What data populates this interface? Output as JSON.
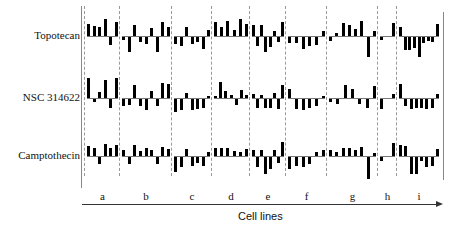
{
  "chart_data": {
    "type": "bar",
    "title": "",
    "xlabel": "Cell lines",
    "ylabel": "",
    "rows": [
      "Topotecan",
      "NSC 314622",
      "Camptothecin"
    ],
    "categories": [
      "a",
      "b",
      "c",
      "d",
      "e",
      "f",
      "g",
      "h",
      "i"
    ],
    "grid": false,
    "note": "Small-multiple bar patterns; values are relative deviations (unitless), positive up, negative down, estimated from pixel heights (scale ~ -1..1).",
    "series": [
      {
        "name": "Topotecan",
        "groups": {
          "a": [
            0.6,
            0.5,
            0.45,
            0.85,
            -0.4,
            0.7
          ],
          "b": [
            -0.15,
            -0.75,
            0.55,
            -0.25,
            -0.35,
            0.4,
            -0.75,
            0.7,
            0.45
          ],
          "c": [
            -0.35,
            -0.45,
            0.45,
            -0.35,
            -0.25,
            -0.6,
            0.3
          ],
          "d": [
            0.7,
            0.45,
            0.75,
            0.3,
            0.85,
            0.6
          ],
          "e": [
            0.55,
            -0.45,
            0.55,
            -0.75,
            -0.5,
            0.25,
            -0.25,
            0.7
          ],
          "f": [
            -0.3,
            -0.3,
            -0.6,
            -0.45,
            -0.4,
            0.25
          ],
          "g": [
            -0.2,
            0.15,
            0.65,
            0.55,
            0.35,
            0.75,
            -1.0,
            0.25
          ],
          "h": [
            -0.15,
            0.65
          ],
          "i": [
            0.45,
            -0.65,
            -0.65,
            -0.55,
            -1.0,
            -0.3,
            -0.2,
            -0.25,
            0.6
          ]
        }
      },
      {
        "name": "NSC 314622",
        "groups": {
          "a": [
            1.0,
            -0.15,
            0.3,
            0.9,
            -0.45,
            1.0
          ],
          "b": [
            -0.35,
            -0.3,
            0.65,
            -0.35,
            -0.55,
            0.35,
            -0.35,
            0.75,
            0.7
          ],
          "c": [
            -0.65,
            -0.55,
            0.25,
            -0.55,
            -0.5,
            -0.45,
            0.1
          ],
          "d": [
            0.1,
            0.8,
            0.35,
            0.15,
            -0.3,
            0.4,
            0.15
          ],
          "e": [
            0.2,
            -0.45,
            0.15,
            -0.45,
            -0.45,
            0.25,
            -0.5,
            0.65
          ],
          "f": [
            0.45,
            -0.5,
            -0.55,
            -0.45,
            -0.35,
            0.1
          ],
          "g": [
            -0.15,
            -0.25,
            0.65,
            0.45,
            -0.25,
            -0.45,
            0.6
          ],
          "h": [
            -0.5,
            0.2
          ],
          "i": [
            0.7,
            -0.35,
            -0.5,
            -0.45,
            -0.45,
            -0.5,
            -0.45,
            0.2
          ]
        }
      },
      {
        "name": "Camptothecin",
        "groups": {
          "a": [
            0.5,
            0.4,
            -0.35,
            0.6,
            0.4,
            0.55
          ],
          "b": [
            0.3,
            -0.35,
            0.55,
            0.25,
            0.4,
            0.3,
            -0.35,
            0.45,
            0.35
          ],
          "c": [
            -0.75,
            -0.5,
            0.35,
            -0.45,
            -0.3,
            -0.45,
            0.2
          ],
          "d": [
            0.4,
            0.4,
            0.4,
            0.25,
            0.2,
            0.35
          ],
          "e": [
            0.3,
            -0.5,
            0.3,
            -0.85,
            -0.6,
            0.3,
            -0.3,
            0.7
          ],
          "f": [
            -0.6,
            -0.45,
            -0.5,
            -0.35,
            0.2,
            0.3
          ],
          "g": [
            0.3,
            0.2,
            0.4,
            0.4,
            0.3,
            0.45,
            -1.1,
            0.15
          ],
          "h": [
            -0.2,
            0.65
          ],
          "i": [
            0.55,
            0.5,
            -0.85,
            -0.85,
            -0.2,
            -0.5,
            -0.45,
            0.35
          ]
        }
      }
    ]
  },
  "labels": {
    "rows": [
      "Topotecan",
      "NSC 314622",
      "Camptothecin"
    ],
    "cols": [
      "a",
      "b",
      "c",
      "d",
      "e",
      "f",
      "g",
      "h",
      "i"
    ],
    "xlabel": "Cell lines"
  },
  "layout": {
    "row_baselines": [
      36,
      98,
      156
    ],
    "row_scale": 20,
    "col_bounds": [
      85,
      120,
      172,
      212,
      250,
      286,
      327,
      378,
      397,
      441
    ]
  }
}
